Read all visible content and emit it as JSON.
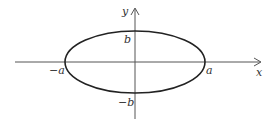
{
  "diagram": {
    "type": "ellipse-on-axes",
    "colors": {
      "background": "#ffffff",
      "ellipse_stroke": "#222222",
      "axis_stroke": "#555555",
      "label": "#333333"
    },
    "axes": {
      "x_label": "x",
      "y_label": "y"
    },
    "ellipse": {
      "center": [
        135,
        62
      ],
      "rx": 70,
      "ry": 31
    },
    "labels": {
      "positive_semi_major": "a",
      "negative_semi_major": "−a",
      "positive_semi_minor": "b",
      "negative_semi_minor": "−b"
    }
  }
}
